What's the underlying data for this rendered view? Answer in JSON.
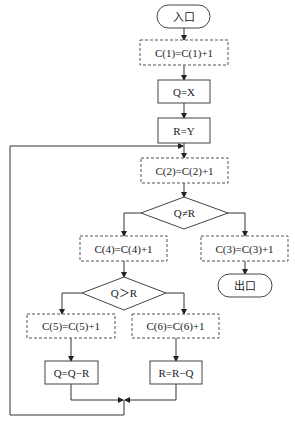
{
  "diagram": {
    "type": "flowchart",
    "nodes": {
      "entry": {
        "label": "入口",
        "shape": "terminal"
      },
      "c1": {
        "label": "C(1)=C(1)+1",
        "shape": "dashed-rect"
      },
      "qx": {
        "label": "Q=X",
        "shape": "rect"
      },
      "ry": {
        "label": "R=Y",
        "shape": "rect"
      },
      "c2": {
        "label": "C(2)=C(2)+1",
        "shape": "dashed-rect"
      },
      "d1": {
        "label": "Q≠R",
        "shape": "diamond"
      },
      "c4": {
        "label": "C(4)=C(4)+1",
        "shape": "dashed-rect"
      },
      "c3": {
        "label": "C(3)=C(3)+1",
        "shape": "dashed-rect"
      },
      "exit": {
        "label": "出口",
        "shape": "terminal"
      },
      "d2": {
        "label": "Q＞R",
        "shape": "diamond"
      },
      "c5": {
        "label": "C(5)=C(5)+1",
        "shape": "dashed-rect"
      },
      "c6": {
        "label": "C(6)=C(6)+1",
        "shape": "dashed-rect"
      },
      "qqr": {
        "label": "Q=Q−R",
        "shape": "rect"
      },
      "rrq": {
        "label": "R=R−Q",
        "shape": "rect"
      }
    },
    "edges": [
      {
        "from": "entry",
        "to": "c1"
      },
      {
        "from": "c1",
        "to": "qx"
      },
      {
        "from": "qx",
        "to": "ry"
      },
      {
        "from": "ry",
        "to": "c2"
      },
      {
        "from": "c2",
        "to": "d1"
      },
      {
        "from": "d1",
        "to": "c4",
        "branch": "left"
      },
      {
        "from": "d1",
        "to": "c3",
        "branch": "right"
      },
      {
        "from": "c3",
        "to": "exit"
      },
      {
        "from": "c4",
        "to": "d2"
      },
      {
        "from": "d2",
        "to": "c5",
        "branch": "left"
      },
      {
        "from": "d2",
        "to": "c6",
        "branch": "right"
      },
      {
        "from": "c5",
        "to": "qqr"
      },
      {
        "from": "c6",
        "to": "rrq"
      },
      {
        "from": "qqr",
        "to": "merge"
      },
      {
        "from": "rrq",
        "to": "merge"
      },
      {
        "from": "merge",
        "to": "c2",
        "type": "loop-back"
      }
    ]
  }
}
